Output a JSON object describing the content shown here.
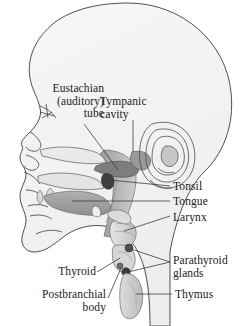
{
  "figure": {
    "name": "head-and-neck-pharyngeal-derivatives-diagram",
    "background_color": "#ffffff",
    "outline_color": "#3c3c3c",
    "interior_fill": "#f4f4f4",
    "shade_light": "#e3e3e3",
    "shade_medium": "#b8b8b8",
    "shade_dark": "#8d8d8d",
    "shade_darkest": "#4a4a4a",
    "text_color": "#1a1a1a",
    "leader_color": "#333333"
  },
  "labels": {
    "eustachian_tube": "Eustachian\n(auditory)\ntube",
    "tympanic_cavity": "Tympanic\ncavity",
    "tonsil": "Tonsil",
    "tongue": "Tongue",
    "larynx": "Larynx",
    "parathyroid_glands": "Parathyroid\nglands",
    "thyroid": "Thyroid",
    "postbranchial_body": "Postbranchial\nbody",
    "thymus": "Thymus"
  },
  "structures": {
    "cranium": "cranium-outline",
    "face": "face-profile",
    "ear": "external-ear-auricle",
    "tympanic": "tympanic-cavity-shape",
    "eustachian": "eustachian-tube-shape",
    "nasal": "nasal-cavity",
    "palate": "palate",
    "tongue": "tongue-shape",
    "pharynx": "pharynx-band",
    "tonsil": "tonsil-marker",
    "larynx": "larynx-shape",
    "thyroid": "thyroid-gland",
    "parathyroid_upper": "parathyroid-gland-upper",
    "parathyroid_lower": "parathyroid-gland-lower",
    "postbranchial": "postbranchial-body-marker",
    "thymus": "thymus-lobe"
  }
}
